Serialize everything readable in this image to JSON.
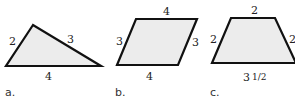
{
  "figures": [
    {
      "id": "a",
      "caption": "a.",
      "type": "triangle",
      "side_labels": {
        "left": "2",
        "right": "3",
        "bottom": "4"
      }
    },
    {
      "id": "b",
      "caption": "b.",
      "type": "parallelogram",
      "side_labels": {
        "top": "4",
        "left": "3",
        "right": "3",
        "bottom": "4"
      }
    },
    {
      "id": "c",
      "caption": "c.",
      "type": "trapezoid",
      "side_labels": {
        "top": "2",
        "left": "2",
        "right": "2",
        "bottom_whole": "3",
        "bottom_fraction": "1/2"
      }
    }
  ],
  "colors": {
    "fill": "#ececec",
    "stroke": "#111111"
  }
}
